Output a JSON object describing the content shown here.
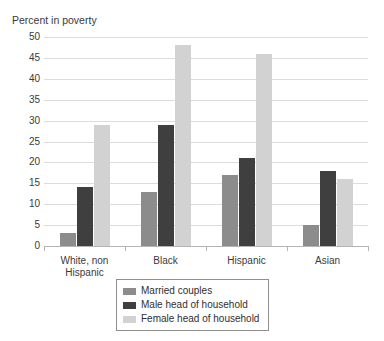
{
  "chart_data": {
    "type": "bar",
    "title": "Percent in poverty",
    "xlabel": "",
    "ylabel": "",
    "ylim": [
      0,
      50
    ],
    "ytick_step": 5,
    "yticks": [
      "50",
      "45",
      "40",
      "35",
      "30",
      "25",
      "20",
      "15",
      "10",
      "5",
      "0"
    ],
    "grid": true,
    "legend_position": "bottom-center",
    "categories": [
      "White, non Hispanic",
      "Black",
      "Hispanic",
      "Asian"
    ],
    "category_lines": [
      [
        "White, non",
        "Hispanic"
      ],
      [
        "Black"
      ],
      [
        "Hispanic"
      ],
      [
        "Asian"
      ]
    ],
    "series": [
      {
        "name": "Married couples",
        "color": "#8c8c8c",
        "values": [
          3,
          13,
          17,
          5
        ]
      },
      {
        "name": "Male head of household",
        "color": "#3f3f3f",
        "values": [
          14,
          29,
          21,
          18
        ]
      },
      {
        "name": "Female head of household",
        "color": "#d2d2d2",
        "values": [
          29,
          48,
          46,
          16
        ]
      }
    ]
  }
}
